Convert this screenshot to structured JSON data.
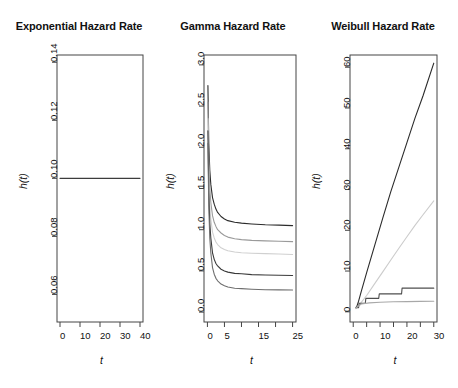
{
  "figure": {
    "width": 458,
    "height": 388,
    "background": "#ffffff",
    "panel_count": 3
  },
  "chart_data": [
    {
      "type": "line",
      "title": "Exponential Hazard Rate",
      "xlabel": "t",
      "ylabel": "h(t)",
      "xlim": [
        -1.5,
        41.5
      ],
      "ylim": [
        0.0505,
        0.1425
      ],
      "xticks": [
        0,
        10,
        20,
        30,
        40
      ],
      "xtick_labels": [
        "0",
        "10",
        "20",
        "30",
        "40"
      ],
      "yticks": [
        0.06,
        0.08,
        0.1,
        0.12,
        0.14
      ],
      "ytick_labels": [
        "0.06",
        "0.08",
        "0.10",
        "0.12",
        "0.14"
      ],
      "grid": false,
      "legend": "none",
      "series": [
        {
          "name": "lambda = 0.1",
          "color": "#3c3c3c",
          "x": [
            0,
            5,
            10,
            15,
            20,
            25,
            30,
            35,
            40
          ],
          "values": [
            0.1,
            0.1,
            0.1,
            0.1,
            0.1,
            0.1,
            0.1,
            0.1,
            0.1
          ]
        }
      ]
    },
    {
      "type": "line",
      "title": "Gamma Hazard Rate",
      "xlabel": "t",
      "ylabel": "h(t)",
      "xlim": [
        -1.0,
        26.0
      ],
      "ylim": [
        -0.12,
        3.12
      ],
      "xticks": [
        0,
        5,
        10,
        15,
        20,
        25
      ],
      "xtick_labels": [
        "0",
        "5",
        "",
        "15",
        "",
        "25"
      ],
      "yticks": [
        0.0,
        0.5,
        1.0,
        1.5,
        2.0,
        2.5,
        3.0
      ],
      "ytick_labels": [
        "0.0",
        "0.5",
        "1.0",
        "1.5",
        "2.0",
        "2.5",
        "3.0"
      ],
      "grid": false,
      "legend": "none",
      "series": [
        {
          "name": "curve-1",
          "color": "#2b2b2b",
          "x": [
            0.15,
            0.4,
            0.7,
            1.0,
            1.5,
            2.0,
            2.5,
            3.0,
            4.0,
            5.0,
            6.0,
            8.0,
            10.0,
            13.0,
            17.0,
            21.0,
            25.0
          ],
          "values": [
            2.75,
            2.05,
            1.72,
            1.55,
            1.39,
            1.31,
            1.25,
            1.21,
            1.16,
            1.13,
            1.11,
            1.09,
            1.08,
            1.07,
            1.06,
            1.055,
            1.05
          ]
        },
        {
          "name": "curve-2",
          "color": "#9a9a9a",
          "x": [
            0.15,
            0.4,
            0.7,
            1.0,
            1.5,
            2.0,
            2.5,
            3.0,
            4.0,
            5.0,
            6.0,
            8.0,
            10.0,
            13.0,
            17.0,
            21.0,
            25.0
          ],
          "values": [
            2.55,
            1.85,
            1.5,
            1.33,
            1.17,
            1.09,
            1.04,
            1.0,
            0.96,
            0.93,
            0.91,
            0.89,
            0.88,
            0.87,
            0.865,
            0.86,
            0.855
          ]
        },
        {
          "name": "curve-3",
          "color": "#d0d0d0",
          "x": [
            0.15,
            0.4,
            0.7,
            1.0,
            1.5,
            2.0,
            2.5,
            3.0,
            4.0,
            5.0,
            6.0,
            8.0,
            10.0,
            13.0,
            17.0,
            21.0,
            25.0
          ],
          "values": [
            2.35,
            1.65,
            1.3,
            1.13,
            0.97,
            0.9,
            0.85,
            0.82,
            0.78,
            0.76,
            0.745,
            0.73,
            0.72,
            0.715,
            0.71,
            0.705,
            0.7
          ]
        },
        {
          "name": "curve-4",
          "color": "#3a3a3a",
          "x": [
            0.15,
            0.4,
            0.7,
            1.0,
            1.5,
            2.0,
            2.5,
            3.0,
            4.0,
            5.0,
            6.0,
            8.0,
            10.0,
            13.0,
            17.0,
            21.0,
            25.0
          ],
          "values": [
            2.2,
            1.45,
            1.08,
            0.9,
            0.72,
            0.64,
            0.59,
            0.56,
            0.52,
            0.5,
            0.485,
            0.47,
            0.465,
            0.455,
            0.45,
            0.448,
            0.445
          ]
        },
        {
          "name": "curve-5",
          "color": "#6e6e6e",
          "x": [
            0.15,
            0.4,
            0.7,
            1.0,
            1.5,
            2.0,
            2.5,
            3.0,
            4.0,
            5.0,
            6.0,
            8.0,
            10.0,
            13.0,
            17.0,
            21.0,
            25.0
          ],
          "values": [
            2.05,
            1.28,
            0.9,
            0.72,
            0.54,
            0.46,
            0.41,
            0.38,
            0.34,
            0.32,
            0.305,
            0.29,
            0.285,
            0.278,
            0.272,
            0.27,
            0.268
          ]
        }
      ]
    },
    {
      "type": "line",
      "title": "Weibull Hazard Rate",
      "xlabel": "t",
      "ylabel": "h(t)",
      "xlim": [
        -1.2,
        31.2
      ],
      "ylim": [
        -2.5,
        63.0
      ],
      "xticks": [
        0,
        5,
        10,
        15,
        20,
        25,
        30
      ],
      "xtick_labels": [
        "0",
        "",
        "10",
        "",
        "20",
        "",
        "30"
      ],
      "yticks": [
        0,
        10,
        20,
        30,
        40,
        50,
        60
      ],
      "ytick_labels": [
        "0",
        "10",
        "20",
        "30",
        "40",
        "50",
        "60"
      ],
      "grid": false,
      "legend": "none",
      "series": [
        {
          "name": "weibull-steep",
          "color": "#2b2b2b",
          "x": [
            1.0,
            1.5,
            2.0,
            3.0,
            5.0,
            8.0,
            11.0,
            14.0,
            17.0,
            20.0,
            23.0,
            26.0,
            30.0
          ],
          "values": [
            1.0,
            1.6,
            2.6,
            5.0,
            9.6,
            16.3,
            23.0,
            29.5,
            35.5,
            41.5,
            47.5,
            53.0,
            61.0
          ]
        },
        {
          "name": "weibull-mid",
          "color": "#cccccc",
          "x": [
            1.0,
            2.0,
            3.0,
            5.0,
            8.0,
            11.0,
            14.0,
            17.0,
            20.0,
            23.0,
            26.0,
            30.0
          ],
          "values": [
            0.8,
            1.5,
            2.3,
            4.0,
            6.9,
            9.8,
            12.7,
            15.6,
            18.4,
            21.2,
            23.8,
            27.2
          ]
        },
        {
          "name": "weibull-step",
          "color": "#4f4f4f",
          "x": [
            1.0,
            2.0,
            2.2,
            4.5,
            4.7,
            9.5,
            9.7,
            18.0,
            18.2,
            30.0
          ],
          "values": [
            1.0,
            1.0,
            2.1,
            2.1,
            3.3,
            3.3,
            4.4,
            4.4,
            5.8,
            5.8
          ]
        },
        {
          "name": "weibull-flat",
          "color": "#a8a8a8",
          "x": [
            1.0,
            3.0,
            6.0,
            10.0,
            15.0,
            20.0,
            25.0,
            30.0
          ],
          "values": [
            1.0,
            1.9,
            2.2,
            2.35,
            2.45,
            2.5,
            2.55,
            2.6
          ]
        }
      ]
    }
  ],
  "panels": [
    {
      "title": "Exponential Hazard Rate",
      "ylabel": "h(t)",
      "xlabel": "t",
      "ytick_labels": [
        "0.06",
        "0.08",
        "0.10",
        "0.12",
        "0.14"
      ],
      "xtick_labels": [
        "0",
        "10",
        "20",
        "30",
        "40"
      ]
    },
    {
      "title": "Gamma Hazard Rate",
      "ylabel": "h(t)",
      "xlabel": "t",
      "ytick_labels": [
        "0.0",
        "0.5",
        "1.0",
        "1.5",
        "2.0",
        "2.5",
        "3.0"
      ],
      "xtick_labels": [
        "0",
        "5",
        "15",
        "25"
      ]
    },
    {
      "title": "Weibull Hazard Rate",
      "ylabel": "h(t)",
      "xlabel": "t",
      "ytick_labels": [
        "0",
        "10",
        "20",
        "30",
        "40",
        "50",
        "60"
      ],
      "xtick_labels": [
        "0",
        "10",
        "20",
        "30"
      ]
    }
  ]
}
